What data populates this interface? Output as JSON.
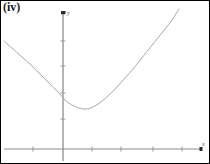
{
  "figure": {
    "label": "(iv)",
    "background_color": "#ffffff",
    "border_color": "#000000"
  },
  "axes": {
    "x_label": "x",
    "y_label": "y",
    "axis_color": "#8c8c8c",
    "tick_color": "#9a9a9a",
    "origin_px": {
      "x": 62,
      "y": 148
    },
    "x_axis_px": {
      "start": 3,
      "end": 200,
      "y": 148
    },
    "y_axis_px": {
      "x": 62,
      "top": 11,
      "bottom": 160
    },
    "x_ticks_px": [
      32,
      91,
      120,
      152,
      181
    ],
    "y_ticks_px": [
      40,
      65,
      92,
      118
    ],
    "y_axis_cap": "dot-marker"
  },
  "chart_data": {
    "type": "line",
    "title": "(iv)",
    "xlabel": "x",
    "ylabel": "y",
    "grid": false,
    "legend": null,
    "annotations": [],
    "curve_name": "upward parabola",
    "vertex": {
      "x": 0.55,
      "y": 1.55
    },
    "xlim": [
      -2.0,
      4.6
    ],
    "ylim": [
      -0.3,
      5.3
    ],
    "x": [
      -2.0,
      -1.7,
      -1.4,
      -1.1,
      -0.8,
      -0.5,
      -0.2,
      0.1,
      0.4,
      0.55,
      0.7,
      1.0,
      1.3,
      1.6,
      1.9,
      2.2,
      2.5,
      2.8,
      3.1,
      3.4,
      3.7,
      3.9
    ],
    "y": [
      4.85,
      4.27,
      3.73,
      3.23,
      2.77,
      2.35,
      1.97,
      1.73,
      1.58,
      1.55,
      1.57,
      1.75,
      2.05,
      2.45,
      2.95,
      3.55,
      4.15,
      4.75,
      5.25,
      5.6,
      5.85,
      6.0
    ],
    "points_px": [
      [
        3,
        40
      ],
      [
        12,
        48
      ],
      [
        21,
        56
      ],
      [
        30,
        64
      ],
      [
        39,
        73
      ],
      [
        48,
        82
      ],
      [
        57,
        91
      ],
      [
        64,
        99
      ],
      [
        71,
        104
      ],
      [
        78,
        107
      ],
      [
        85,
        108
      ],
      [
        92,
        106
      ],
      [
        100,
        101
      ],
      [
        108,
        94
      ],
      [
        116,
        86
      ],
      [
        124,
        77
      ],
      [
        132,
        68
      ],
      [
        140,
        58
      ],
      [
        148,
        48
      ],
      [
        156,
        38
      ],
      [
        164,
        28
      ],
      [
        171,
        19
      ],
      [
        178,
        8
      ]
    ],
    "curve_color": "#a8a8a8",
    "curve_width": 1.0
  }
}
